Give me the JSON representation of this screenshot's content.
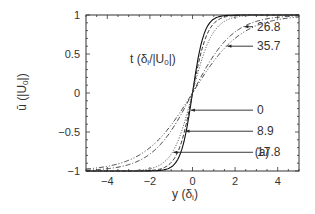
{
  "chart_data": {
    "type": "line",
    "title": "",
    "panel_label": "(a)",
    "xlabel": "y (δ_i)",
    "ylabel": "ū (|U_0|)",
    "xlim": [
      -5,
      5
    ],
    "ylim": [
      -1,
      1
    ],
    "xticks": [
      -4,
      -2,
      0,
      2,
      4
    ],
    "xtick_labels": [
      "−4",
      "−2",
      "0",
      "2",
      "4"
    ],
    "yticks": [
      -1,
      -0.5,
      0,
      0.5,
      1
    ],
    "ytick_labels": [
      "−1",
      "−0.5",
      "0",
      "0.5",
      "1"
    ],
    "grid": false,
    "legend_title": "t (δ_i/|U_0|)",
    "series": [
      {
        "name": "0",
        "style": "solid",
        "color": "#111111",
        "width_param": 0.55,
        "x": [
          -5,
          -2,
          -1.5,
          -1,
          -0.5,
          0,
          0.5,
          1,
          1.5,
          2,
          5
        ],
        "y": [
          -1,
          -0.998,
          -0.98,
          -0.87,
          -0.55,
          0,
          0.55,
          0.87,
          0.98,
          0.998,
          1
        ]
      },
      {
        "name": "8.9",
        "style": "dashed",
        "color": "#222222",
        "width_param": 0.7,
        "x": [
          -5,
          -2,
          -1.5,
          -1,
          -0.5,
          0,
          0.5,
          1,
          1.5,
          2,
          5
        ],
        "y": [
          -1,
          -0.99,
          -0.95,
          -0.8,
          -0.47,
          0,
          0.47,
          0.8,
          0.95,
          0.99,
          1
        ]
      },
      {
        "name": "17.8",
        "style": "dotted",
        "color": "#555555",
        "width_param": 0.95,
        "x": [
          -5,
          -2.5,
          -2,
          -1.5,
          -1,
          -0.5,
          0,
          0.5,
          1,
          1.5,
          2,
          2.5,
          5
        ],
        "y": [
          -1,
          -0.995,
          -0.97,
          -0.9,
          -0.72,
          -0.39,
          0,
          0.39,
          0.72,
          0.9,
          0.97,
          0.995,
          1
        ]
      },
      {
        "name": "26.8",
        "style": "dashdot",
        "color": "#333333",
        "width_param": 1.9,
        "x": [
          -5,
          -3,
          -2,
          -1,
          0,
          1,
          2,
          3,
          5
        ],
        "y": [
          -1,
          -0.98,
          -0.86,
          -0.5,
          0,
          0.5,
          0.86,
          0.98,
          1
        ]
      },
      {
        "name": "35.7",
        "style": "dashdotdot",
        "color": "#333333",
        "width_param": 2.3,
        "x": [
          -5,
          -3.5,
          -3,
          -2,
          -1,
          0,
          1,
          2,
          3,
          3.5,
          5
        ],
        "y": [
          -1,
          -0.98,
          -0.94,
          -0.76,
          -0.42,
          0,
          0.42,
          0.76,
          0.94,
          0.98,
          1
        ]
      }
    ],
    "annotations": [
      {
        "text": "0",
        "label_xy": [
          3.5,
          -0.22
        ]
      },
      {
        "text": "8.9",
        "label_xy": [
          3.5,
          -0.49
        ]
      },
      {
        "text": "17.8",
        "label_xy": [
          3.5,
          -0.76
        ]
      },
      {
        "text": "26.8",
        "label_xy": [
          3.5,
          0.85
        ]
      },
      {
        "text": "35.7",
        "label_xy": [
          3.5,
          0.6
        ]
      }
    ]
  }
}
